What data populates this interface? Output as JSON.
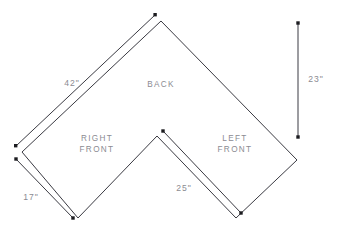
{
  "diagram": {
    "background_color": "#ffffff",
    "line_color": "#3a3a42",
    "label_color": "#8b8b92",
    "cap_color": "#1c1c20",
    "area_labels": [
      {
        "name": "back",
        "text": "BACK",
        "x": 161,
        "y": 85
      },
      {
        "name": "right-front",
        "line1": "RIGHT",
        "line2": "FRONT",
        "x": 97,
        "y": 143
      },
      {
        "name": "left-front",
        "line1": "LEFT",
        "line2": "FRONT",
        "x": 235,
        "y": 143
      }
    ],
    "dimensions": [
      {
        "name": "back-left-edge",
        "label": "42\"",
        "label_x": 72,
        "label_y": 84,
        "from": {
          "x": 22,
          "y": 152
        },
        "to": {
          "x": 161,
          "y": 21
        }
      },
      {
        "name": "right-front-edge",
        "label": "17\"",
        "label_x": 31,
        "label_y": 198,
        "from": {
          "x": 22,
          "y": 160
        },
        "to": {
          "x": 78,
          "y": 218
        }
      },
      {
        "name": "left-front-inner-edge",
        "label": "25\"",
        "label_x": 184,
        "label_y": 189,
        "from": {
          "x": 161,
          "y": 137
        },
        "to": {
          "x": 236,
          "y": 218
        }
      },
      {
        "name": "overall-depth",
        "label": "23\"",
        "label_x": 315,
        "label_y": 80,
        "from": {
          "x": 298,
          "y": 23
        },
        "to": {
          "x": 298,
          "y": 137
        }
      }
    ],
    "outline_points": "161,21 297,160 236,218 157,136 78,218 22,152 161,21"
  }
}
